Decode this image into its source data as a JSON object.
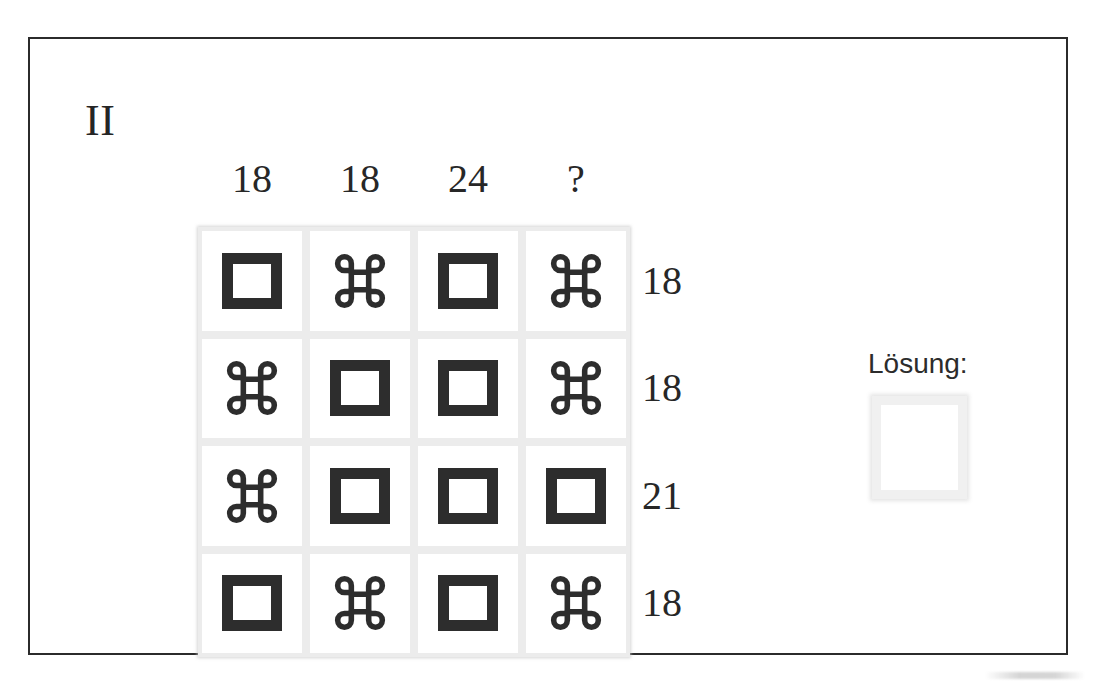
{
  "exercise": {
    "label": "II"
  },
  "puzzle": {
    "type": "symbol-sum-grid",
    "rows": 4,
    "cols": 4,
    "symbols": {
      "square": "□",
      "command": "⌘"
    },
    "column_sums": [
      "18",
      "18",
      "24",
      "?"
    ],
    "row_sums": [
      "18",
      "18",
      "21",
      "18"
    ],
    "cells": [
      [
        "square",
        "command",
        "square",
        "command"
      ],
      [
        "command",
        "square",
        "square",
        "command"
      ],
      [
        "command",
        "square",
        "square",
        "square"
      ],
      [
        "square",
        "command",
        "square",
        "command"
      ]
    ],
    "icon_names": {
      "square": "square-symbol-icon",
      "command": "command-symbol-icon"
    }
  },
  "answer": {
    "label": "Lösung:",
    "value": ""
  },
  "colors": {
    "frame": "#2b2b2b",
    "ink": "#2d2d2d",
    "text": "#272727",
    "gridline": "#ececec",
    "answer_box_border": "#f0f0f0",
    "page": "#ffffff"
  }
}
